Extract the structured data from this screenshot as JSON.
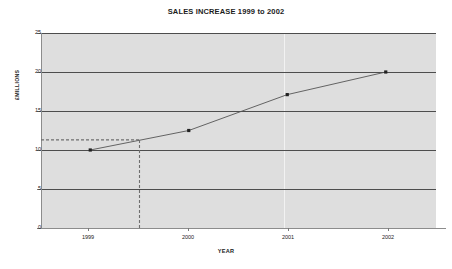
{
  "chart_data": {
    "type": "line",
    "title": "SALES INCREASE 1999 to 2002",
    "xlabel": "YEAR",
    "ylabel": "£MILLIONS",
    "x": [
      1999,
      2000,
      2001,
      2002
    ],
    "categories": [
      "1999",
      "2000",
      "2001",
      "2002"
    ],
    "values": [
      10.0,
      12.5,
      17.1,
      20.0
    ],
    "series": [
      {
        "name": "Sales",
        "values": [
          10.0,
          12.5,
          17.1,
          20.0
        ]
      }
    ],
    "xlim": [
      1998.5,
      2002.5
    ],
    "ylim": [
      0,
      25
    ],
    "yticks": [
      0,
      5,
      10,
      15,
      20,
      25
    ],
    "ytick_labels": [
      "0",
      "5",
      "10",
      "15",
      "20",
      "25"
    ],
    "xticks": [
      1999,
      2000,
      2001,
      2002
    ],
    "xtick_labels": [
      "1999",
      "2000",
      "2001",
      "2002"
    ],
    "grid": "horizontal",
    "legend": "none",
    "marker": "square",
    "annotations": [
      {
        "type": "guide-line-horizontal",
        "style": "dashed",
        "y_value": 11.3,
        "from_x": 1998.5,
        "to_x": 1999.5
      },
      {
        "type": "guide-line-vertical",
        "style": "dashed",
        "x_value": 1999.5,
        "from_y": 0,
        "to_y": 11.3
      }
    ],
    "colors": {
      "plot_background": "#dedede",
      "page_background": "#ffffff",
      "gridline": "#4d4d4d",
      "series_line": "#555555",
      "marker": "#222222",
      "guide_line": "#6e6e6e",
      "axis_line": "#8c8c8c",
      "text": "#1c1c1c"
    }
  }
}
